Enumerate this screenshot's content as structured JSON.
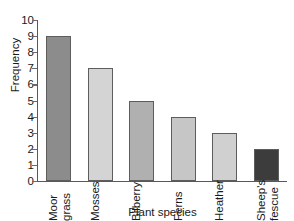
{
  "chart_data": {
    "type": "bar",
    "title": "",
    "xlabel": "Plant species",
    "ylabel": "Frequency",
    "categories": [
      "Moor grass",
      "Mosses",
      "Bilberry",
      "Ferns",
      "Heather",
      "Sheep's fescue"
    ],
    "category_lines": [
      [
        "Moor",
        "grass"
      ],
      [
        "Mosses"
      ],
      [
        "Bilberry"
      ],
      [
        "Ferns"
      ],
      [
        "Heather"
      ],
      [
        "Sheep's",
        "fescue"
      ]
    ],
    "values": [
      9,
      7,
      5,
      4,
      3,
      2
    ],
    "bar_colors": [
      "#8c8c8c",
      "#d4d4d4",
      "#b0b0b0",
      "#c6c6c6",
      "#d0d0d0",
      "#3c3c3c"
    ],
    "bar_border_color": "#5d5d5d",
    "ylim": [
      0,
      10
    ],
    "ytick_labels": [
      "10",
      "9",
      "8",
      "7",
      "6",
      "5",
      "4",
      "3",
      "2",
      "1",
      "0"
    ],
    "ytick_values": [
      10,
      9,
      8,
      7,
      6,
      5,
      4,
      3,
      2,
      1,
      0
    ],
    "grid": false,
    "legend": false,
    "axis_color": "#595959",
    "background": "#ffffff"
  }
}
